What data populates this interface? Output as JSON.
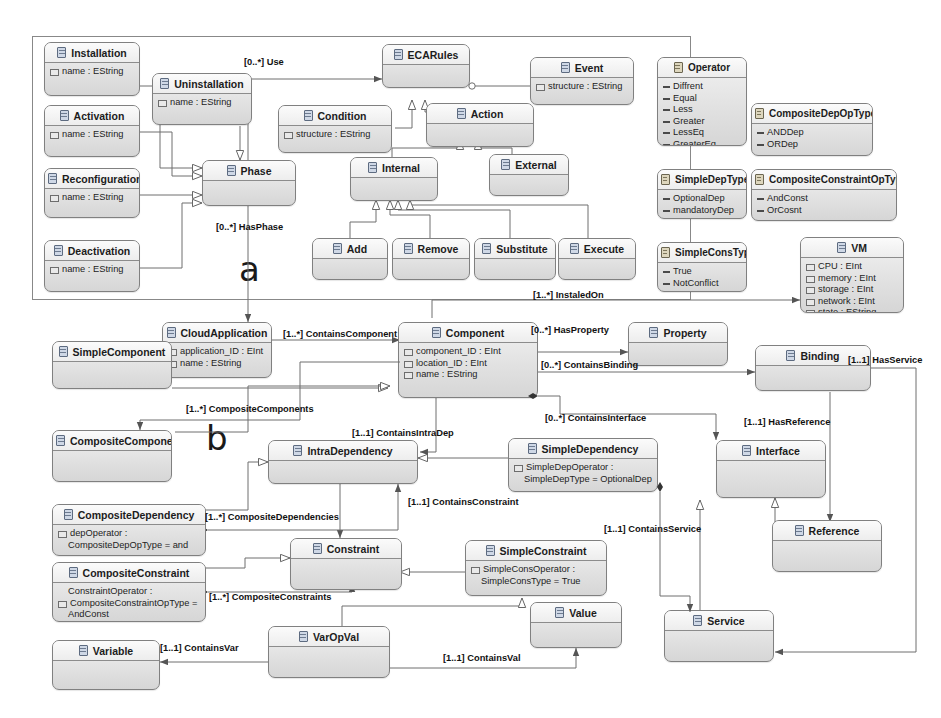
{
  "diagram": {
    "panels": [
      {
        "id": "a",
        "letter": "a"
      },
      {
        "id": "b",
        "letter": "b"
      }
    ]
  },
  "classes": {
    "installation": {
      "name": "Installation",
      "attributes": [
        "name : EString"
      ]
    },
    "activation": {
      "name": "Activation",
      "attributes": [
        "name : EString"
      ]
    },
    "reconfiguration": {
      "name": "Reconfiguration",
      "attributes": [
        "name : EString"
      ]
    },
    "deactivation": {
      "name": "Deactivation",
      "attributes": [
        "name : EString"
      ]
    },
    "uninstallation": {
      "name": "Uninstallation",
      "attributes": [
        "name : EString"
      ]
    },
    "phase": {
      "name": "Phase",
      "attributes": []
    },
    "ecarules": {
      "name": "ECARules",
      "attributes": []
    },
    "event": {
      "name": "Event",
      "attributes": [
        "structure : EString"
      ]
    },
    "condition": {
      "name": "Condition",
      "attributes": [
        "structure : EString"
      ]
    },
    "action": {
      "name": "Action",
      "attributes": []
    },
    "internal": {
      "name": "Internal",
      "attributes": []
    },
    "external": {
      "name": "External",
      "attributes": []
    },
    "add": {
      "name": "Add",
      "attributes": []
    },
    "remove": {
      "name": "Remove",
      "attributes": []
    },
    "substitute": {
      "name": "Substitute",
      "attributes": []
    },
    "execute": {
      "name": "Execute",
      "attributes": []
    },
    "vm": {
      "name": "VM",
      "attributes": [
        "CPU : EInt",
        "memory : EInt",
        "storage : EInt",
        "network : EInt",
        "state : EString"
      ]
    },
    "cloudapplication": {
      "name": "CloudApplication",
      "attributes": [
        "application_ID : EInt",
        "name : EString"
      ]
    },
    "component": {
      "name": "Component",
      "attributes": [
        "component_ID : EInt",
        "location_ID : EInt",
        "name : EString"
      ]
    },
    "property": {
      "name": "Property",
      "attributes": []
    },
    "simplecomponent": {
      "name": "SimpleComponent",
      "attributes": []
    },
    "compositecomponent": {
      "name": "CompositeComponent",
      "attributes": []
    },
    "binding": {
      "name": "Binding",
      "attributes": []
    },
    "interface": {
      "name": "Interface",
      "attributes": []
    },
    "reference": {
      "name": "Reference",
      "attributes": []
    },
    "service": {
      "name": "Service",
      "attributes": []
    },
    "intradependency": {
      "name": "IntraDependency",
      "attributes": []
    },
    "simpledependency": {
      "name": "SimpleDependency",
      "attributes": [
        "SimpleDepOperator :",
        "SimpleDepType = OptionalDep"
      ]
    },
    "compositedependency": {
      "name": "CompositeDependency",
      "attributes": [
        "depOperator :",
        "CompositeDepOpType = and"
      ]
    },
    "constraint": {
      "name": "Constraint",
      "attributes": []
    },
    "simpleconstraint": {
      "name": "SimpleConstraint",
      "attributes": [
        "SimpleConsOperator :",
        "SimpleConsType = True"
      ]
    },
    "compositeconstraint": {
      "name": "CompositeConstraint",
      "attributes": [
        "ConstraintOperator :",
        "CompositeConstraintOpType =",
        "AndConst"
      ]
    },
    "variable": {
      "name": "Variable",
      "attributes": []
    },
    "varopval": {
      "name": "VarOpVal",
      "attributes": []
    },
    "value": {
      "name": "Value",
      "attributes": []
    }
  },
  "enums": {
    "operator": {
      "name": "Operator",
      "literals": [
        "Diffrent",
        "Equal",
        "Less",
        "Greater",
        "LessEq",
        "GreaterEq"
      ]
    },
    "compositedepoptype": {
      "name": "CompositeDepOpType",
      "literals": [
        "ANDDep",
        "ORDep"
      ]
    },
    "simpledeptype": {
      "name": "SimpleDepType",
      "literals": [
        "OptionalDep",
        "mandatoryDep"
      ]
    },
    "compositeconstraintoptype": {
      "name": "CompositeConstraintOpType",
      "literals": [
        "AndConst",
        "OrCosnt"
      ]
    },
    "simpleconstype": {
      "name": "SimpleConsType",
      "literals": [
        "True",
        "NotConflict"
      ]
    }
  },
  "edge_labels": {
    "use": "[0..*] Use",
    "hasphase": "[0..*] HasPhase",
    "instaledon": "[1..*] InstaledOn",
    "containscomponent": "[1..*] ContainsComponent",
    "hasproperty": "[0..*] HasProperty",
    "containsbinding": "[0..*] ContainsBinding",
    "containsinterface": "[0..*] ContainsInterface",
    "hasservice": "[1..1] HasService",
    "hasreference": "[1..1] HasReference",
    "compositecomponents": "[1..*] CompositeComponents",
    "containsintradep": "[1..1] ContainsIntraDep",
    "compositedependencies": "[1..*] CompositeDependencies",
    "containsconstraint": "[1..1] ContainsConstraint",
    "containsservice": "[1..1] ContainsService",
    "compositeconstraints": "[1..*] CompositeConstraints",
    "containsvar": "[1..1] ContainsVar",
    "containsval": "[1..1] ContainsVal"
  },
  "colors": {
    "box_border": "#808080",
    "box_fill_top": "#f2f2f2",
    "box_fill_bottom": "#d6d6d6",
    "line": "#6e6e6e",
    "text": "#1c1c1c"
  }
}
